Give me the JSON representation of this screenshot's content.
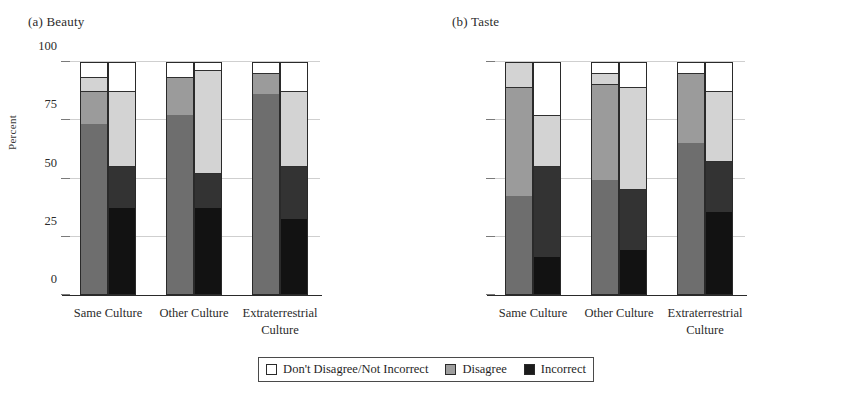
{
  "figure": {
    "ylabel": "Percent",
    "yticks": [
      0,
      25,
      50,
      75,
      100
    ],
    "panels": [
      {
        "title": "(a) Beauty"
      },
      {
        "title": "(b) Taste"
      }
    ],
    "categories": [
      "Same Culture",
      "Other Culture",
      "Extraterrestrial Culture"
    ],
    "category_lines": [
      [
        "Same Culture"
      ],
      [
        "Other Culture"
      ],
      [
        "Extraterrestrial",
        "Culture"
      ]
    ]
  },
  "legend": {
    "position": "bottom-center",
    "items": [
      {
        "label": "Don't Disagree/Not Incorrect",
        "color": "#ffffff"
      },
      {
        "label": "Disagree",
        "color": "#9e9e9e"
      },
      {
        "label": "Incorrect",
        "color": "#1c1c1c"
      }
    ]
  },
  "colors": {
    "incorrect_dark": "#121212",
    "incorrect_mid": "#333333",
    "disagree_dark": "#6e6e6e",
    "disagree_mid": "#9b9b9b",
    "disagree_light": "#d3d3d3",
    "dont_disagree": "#ffffff",
    "gridline": "#cfcfcf",
    "axis": "#2a2a2a"
  },
  "chart_data": {
    "type": "bar",
    "subtype": "stacked-100-percent-grouped",
    "xlabel": "",
    "ylabel": "Percent",
    "ylim": [
      0,
      100
    ],
    "yticks": [
      0,
      25,
      50,
      75,
      100
    ],
    "grid": true,
    "legend": [
      "Don't Disagree/Not Incorrect",
      "Disagree",
      "Incorrect"
    ],
    "categories": [
      "Same Culture",
      "Other Culture",
      "Extraterrestrial Culture"
    ],
    "panels": [
      {
        "name": "(a) Beauty",
        "groups": [
          {
            "category": "Same Culture",
            "bars": [
              {
                "name": "bar-1",
                "segments": [
                  {
                    "label": "Incorrect",
                    "shade": "disagree_dark",
                    "from": 0,
                    "to": 73
                  },
                  {
                    "label": "Disagree",
                    "shade": "disagree_mid",
                    "from": 73,
                    "to": 87
                  },
                  {
                    "label": "Disagree",
                    "shade": "disagree_light",
                    "from": 87,
                    "to": 93
                  },
                  {
                    "label": "Don't Disagree/Not Incorrect",
                    "shade": "dont_disagree",
                    "from": 93,
                    "to": 100
                  }
                ]
              },
              {
                "name": "bar-2",
                "segments": [
                  {
                    "label": "Incorrect",
                    "shade": "incorrect_dark",
                    "from": 0,
                    "to": 37
                  },
                  {
                    "label": "Incorrect",
                    "shade": "incorrect_mid",
                    "from": 37,
                    "to": 55
                  },
                  {
                    "label": "Disagree",
                    "shade": "disagree_light",
                    "from": 55,
                    "to": 87
                  },
                  {
                    "label": "Don't Disagree/Not Incorrect",
                    "shade": "dont_disagree",
                    "from": 87,
                    "to": 100
                  }
                ]
              }
            ]
          },
          {
            "category": "Other Culture",
            "bars": [
              {
                "name": "bar-1",
                "segments": [
                  {
                    "label": "Incorrect",
                    "shade": "disagree_dark",
                    "from": 0,
                    "to": 77
                  },
                  {
                    "label": "Disagree",
                    "shade": "disagree_mid",
                    "from": 77,
                    "to": 93
                  },
                  {
                    "label": "Don't Disagree/Not Incorrect",
                    "shade": "dont_disagree",
                    "from": 93,
                    "to": 100
                  }
                ]
              },
              {
                "name": "bar-2",
                "segments": [
                  {
                    "label": "Incorrect",
                    "shade": "incorrect_dark",
                    "from": 0,
                    "to": 37
                  },
                  {
                    "label": "Incorrect",
                    "shade": "incorrect_mid",
                    "from": 37,
                    "to": 52
                  },
                  {
                    "label": "Disagree",
                    "shade": "disagree_light",
                    "from": 52,
                    "to": 96
                  },
                  {
                    "label": "Don't Disagree/Not Incorrect",
                    "shade": "dont_disagree",
                    "from": 96,
                    "to": 100
                  }
                ]
              }
            ]
          },
          {
            "category": "Extraterrestrial Culture",
            "bars": [
              {
                "name": "bar-1",
                "segments": [
                  {
                    "label": "Incorrect",
                    "shade": "disagree_dark",
                    "from": 0,
                    "to": 86
                  },
                  {
                    "label": "Disagree",
                    "shade": "disagree_mid",
                    "from": 86,
                    "to": 95
                  },
                  {
                    "label": "Don't Disagree/Not Incorrect",
                    "shade": "dont_disagree",
                    "from": 95,
                    "to": 100
                  }
                ]
              },
              {
                "name": "bar-2",
                "segments": [
                  {
                    "label": "Incorrect",
                    "shade": "incorrect_dark",
                    "from": 0,
                    "to": 32
                  },
                  {
                    "label": "Incorrect",
                    "shade": "incorrect_mid",
                    "from": 32,
                    "to": 55
                  },
                  {
                    "label": "Disagree",
                    "shade": "disagree_light",
                    "from": 55,
                    "to": 87
                  },
                  {
                    "label": "Don't Disagree/Not Incorrect",
                    "shade": "dont_disagree",
                    "from": 87,
                    "to": 100
                  }
                ]
              }
            ]
          }
        ]
      },
      {
        "name": "(b) Taste",
        "groups": [
          {
            "category": "Same Culture",
            "bars": [
              {
                "name": "bar-1",
                "segments": [
                  {
                    "label": "Incorrect",
                    "shade": "disagree_dark",
                    "from": 0,
                    "to": 42
                  },
                  {
                    "label": "Disagree",
                    "shade": "disagree_mid",
                    "from": 42,
                    "to": 89
                  },
                  {
                    "label": "Don't Disagree/Not Incorrect",
                    "shade": "disagree_light",
                    "from": 89,
                    "to": 100
                  }
                ]
              },
              {
                "name": "bar-2",
                "segments": [
                  {
                    "label": "Incorrect",
                    "shade": "incorrect_dark",
                    "from": 0,
                    "to": 16
                  },
                  {
                    "label": "Incorrect",
                    "shade": "incorrect_mid",
                    "from": 16,
                    "to": 55
                  },
                  {
                    "label": "Disagree",
                    "shade": "disagree_light",
                    "from": 55,
                    "to": 77
                  },
                  {
                    "label": "Don't Disagree/Not Incorrect",
                    "shade": "dont_disagree",
                    "from": 77,
                    "to": 100
                  }
                ]
              }
            ]
          },
          {
            "category": "Other Culture",
            "bars": [
              {
                "name": "bar-1",
                "segments": [
                  {
                    "label": "Incorrect",
                    "shade": "disagree_dark",
                    "from": 0,
                    "to": 49
                  },
                  {
                    "label": "Disagree",
                    "shade": "disagree_mid",
                    "from": 49,
                    "to": 90
                  },
                  {
                    "label": "Disagree",
                    "shade": "disagree_light",
                    "from": 90,
                    "to": 95
                  },
                  {
                    "label": "Don't Disagree/Not Incorrect",
                    "shade": "dont_disagree",
                    "from": 95,
                    "to": 100
                  }
                ]
              },
              {
                "name": "bar-2",
                "segments": [
                  {
                    "label": "Incorrect",
                    "shade": "incorrect_dark",
                    "from": 0,
                    "to": 19
                  },
                  {
                    "label": "Incorrect",
                    "shade": "incorrect_mid",
                    "from": 19,
                    "to": 45
                  },
                  {
                    "label": "Disagree",
                    "shade": "disagree_light",
                    "from": 45,
                    "to": 89
                  },
                  {
                    "label": "Don't Disagree/Not Incorrect",
                    "shade": "dont_disagree",
                    "from": 89,
                    "to": 100
                  }
                ]
              }
            ]
          },
          {
            "category": "Extraterrestrial Culture",
            "bars": [
              {
                "name": "bar-1",
                "segments": [
                  {
                    "label": "Incorrect",
                    "shade": "disagree_dark",
                    "from": 0,
                    "to": 65
                  },
                  {
                    "label": "Disagree",
                    "shade": "disagree_mid",
                    "from": 65,
                    "to": 95
                  },
                  {
                    "label": "Don't Disagree/Not Incorrect",
                    "shade": "dont_disagree",
                    "from": 95,
                    "to": 100
                  }
                ]
              },
              {
                "name": "bar-2",
                "segments": [
                  {
                    "label": "Incorrect",
                    "shade": "incorrect_dark",
                    "from": 0,
                    "to": 35
                  },
                  {
                    "label": "Incorrect",
                    "shade": "incorrect_mid",
                    "from": 35,
                    "to": 57
                  },
                  {
                    "label": "Disagree",
                    "shade": "disagree_light",
                    "from": 57,
                    "to": 87
                  },
                  {
                    "label": "Don't Disagree/Not Incorrect",
                    "shade": "dont_disagree",
                    "from": 87,
                    "to": 100
                  }
                ]
              }
            ]
          }
        ]
      }
    ]
  }
}
